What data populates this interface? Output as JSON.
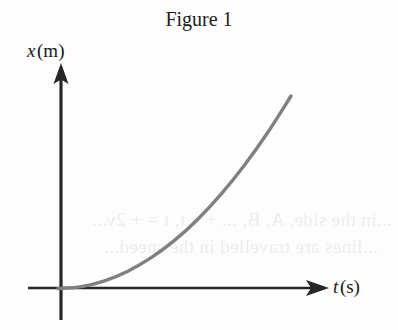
{
  "figure": {
    "title": "Figure 1",
    "background_color": "#fdfdfd",
    "axis_color": "#262626",
    "curve_color": "#808080"
  },
  "axes": {
    "y": {
      "symbol": "x",
      "unit": "(m)",
      "label": "x (m)",
      "quantity": "position",
      "arrow": "up"
    },
    "x": {
      "symbol": "t",
      "unit": "(s)",
      "label": "t (s)",
      "quantity": "time",
      "arrow": "right"
    }
  },
  "ghost_text": {
    "note": "faint mirrored show-through text from reverse of page",
    "line1": "...in the side, A, B, ... + v t, t = + 2v...",
    "line2": "...lines are travelled in the speed..."
  },
  "chart_data": {
    "type": "line",
    "title": "Figure 1",
    "xlabel": "t (s)",
    "ylabel": "x (m)",
    "grid": false,
    "legend": null,
    "axis_ticks": [],
    "series": [
      {
        "name": "position vs time",
        "color": "#808080",
        "x": [
          0.0,
          0.1,
          0.2,
          0.3,
          0.4,
          0.5,
          0.6,
          0.7,
          0.8,
          0.9,
          1.0
        ],
        "y": [
          0.0,
          0.01,
          0.04,
          0.09,
          0.16,
          0.25,
          0.36,
          0.49,
          0.64,
          0.81,
          1.0
        ]
      }
    ],
    "xlim": [
      0,
      1.05
    ],
    "ylim": [
      0,
      1.05
    ]
  }
}
